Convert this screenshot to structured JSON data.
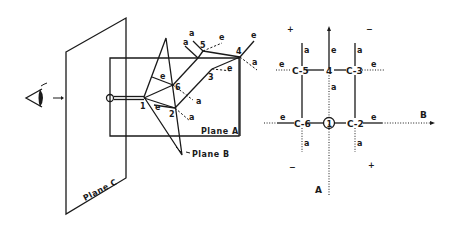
{
  "figure": {
    "perspective_view": {
      "viewer": "eye-icon",
      "planes": {
        "plane_a": "Plane A",
        "plane_b": "Plane B",
        "plane_c": "Plane C"
      },
      "atoms": [
        "1",
        "2",
        "3",
        "4",
        "5",
        "6"
      ],
      "bond_labels": {
        "axial": "a",
        "equatorial": "e"
      },
      "oxygen": "O"
    },
    "projection": {
      "axis_a": "A",
      "axis_b": "B",
      "ring_atom_center": "1",
      "atoms": {
        "c5": "C-5",
        "c4": "4",
        "c3": "C-3",
        "c6": "C-6",
        "c2": "C-2"
      },
      "axial": "a",
      "equatorial": "e",
      "signs": {
        "top_left": "+",
        "top_right": "−",
        "bottom_left": "−",
        "bottom_right": "+"
      }
    }
  }
}
